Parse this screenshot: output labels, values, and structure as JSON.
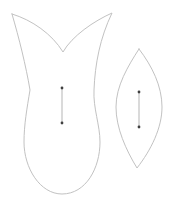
{
  "canvas": {
    "width": 176,
    "height": 210,
    "background": "#ffffff"
  },
  "colors": {
    "outline": "#c2c2c2",
    "grain_line": "#b5b5b5",
    "marker": "#404040"
  },
  "shapes": {
    "large_petal": {
      "outline_path": "M12,14 C32,20 52,34 63,52 C72,36 94,21 112,13 C100,38 95,64 94,90 C93,108 100,125 100,142 C100,168 86,194 62,194 C40,194 24,168 24,142 C24,125 27,108 30,90 C26,66 19,38 12,14 Z",
      "grain_line_path": "M62,88 L62,123",
      "markers": [
        {
          "cx": 62,
          "cy": 88
        },
        {
          "cx": 62,
          "cy": 123
        }
      ]
    },
    "small_leaf": {
      "outline_path": "M139,49 C152,66 162,86 162,107 C162,128 151,150 137,168 C126,150 116,128 116,107 C116,86 128,66 139,49 Z",
      "grain_line_path": "M139,92 L139,127",
      "markers": [
        {
          "cx": 139,
          "cy": 92
        },
        {
          "cx": 139,
          "cy": 127
        }
      ]
    }
  }
}
